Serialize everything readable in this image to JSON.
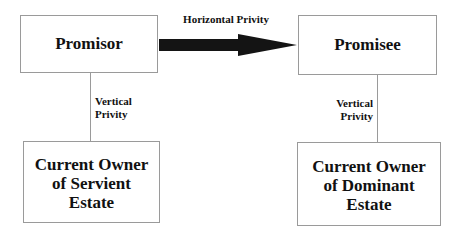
{
  "diagram": {
    "nodes": {
      "promisor": "Promisor",
      "promisee": "Promisee",
      "servient": [
        "Current Owner",
        "of Servient",
        "Estate"
      ],
      "dominant": [
        "Current Owner",
        "of Dominant",
        "Estate"
      ]
    },
    "edges": {
      "horizontal": {
        "label": "Horizontal Privity",
        "from": "Promisor",
        "to": "Promisee"
      },
      "vertical_left": {
        "label": [
          "Vertical",
          "Privity"
        ],
        "from": "Promisor",
        "to": "Current Owner of Servient Estate"
      },
      "vertical_right": {
        "label": [
          "Vertical",
          "Privity"
        ],
        "from": "Promisee",
        "to": "Current Owner of Dominant Estate"
      }
    },
    "colors": {
      "arrow": "#141414",
      "border": "#9a9a9a",
      "text": "#111111"
    }
  }
}
